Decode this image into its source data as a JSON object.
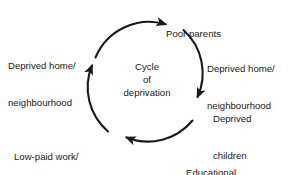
{
  "diagram": {
    "title": "Cycle of deprivation",
    "type": "cycle-diagram",
    "center": {
      "line1": "Cycle",
      "line2": "of",
      "line3": "deprivation"
    },
    "stroke_color": "#1a1a1a",
    "background_color": "#ffffff",
    "text_color": "#1a1a1a",
    "nodes": [
      {
        "id": "poor-parents",
        "label": "Poor parents",
        "position": "top"
      },
      {
        "id": "deprived-home-right",
        "line1": "Deprived home/",
        "line2": "neighbourhood",
        "position": "upper-right"
      },
      {
        "id": "deprived-children",
        "line1": "Deprived",
        "line2": "children",
        "position": "lower-right"
      },
      {
        "id": "educational-failure",
        "line1": "Educational",
        "line2": "failure",
        "position": "bottom-right"
      },
      {
        "id": "low-paid-work",
        "line1": "Low-paid work/",
        "line2": "unemployment",
        "position": "bottom-left"
      },
      {
        "id": "deprived-home-left",
        "line1": "Deprived home/",
        "line2": "neighbourhood",
        "position": "upper-left"
      }
    ],
    "arrows": [
      {
        "id": "arrow-top",
        "direction": "right",
        "from": "deprived-home-left",
        "to": "poor-parents"
      },
      {
        "id": "arrow-right",
        "direction": "down",
        "from": "deprived-home-right",
        "to": "deprived-children"
      },
      {
        "id": "arrow-bottom",
        "direction": "left",
        "from": "educational-failure",
        "to": "low-paid-work"
      },
      {
        "id": "arrow-left",
        "direction": "up",
        "from": "low-paid-work",
        "to": "deprived-home-left"
      }
    ]
  }
}
